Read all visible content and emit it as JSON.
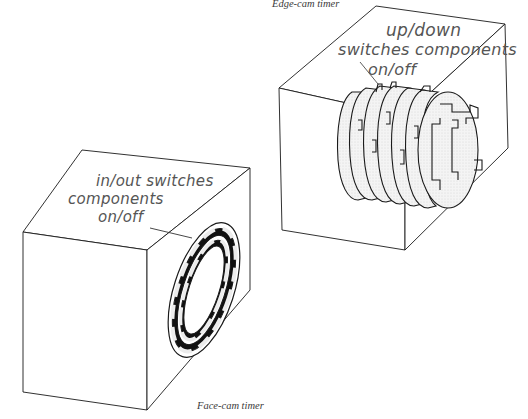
{
  "diagram": {
    "type": "technical-illustration",
    "colors": {
      "line": "#1a1a1a",
      "fill_light": "#ececec",
      "fill_dark": "#111111",
      "handwriting": "#555555",
      "caption": "#3a3a3a",
      "background": "#ffffff"
    },
    "edge_cam": {
      "caption": "Edge-cam timer",
      "annotation": {
        "line1": "up/down",
        "line2": "switches components",
        "line3": "on/off"
      }
    },
    "face_cam": {
      "caption": "Face-cam timer",
      "annotation": {
        "line1": "in/out switches",
        "line2": "components",
        "line3": "on/off"
      }
    }
  }
}
